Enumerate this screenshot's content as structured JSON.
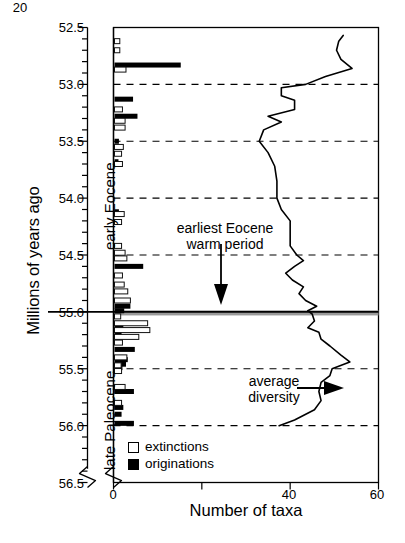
{
  "axes": {
    "ylabel": "Millions of years ago",
    "xlabel": "Number of taxa",
    "y_ticks": [
      "52.5",
      "53.0",
      "53.5",
      "54.0",
      "54.5",
      "55.0",
      "55.5",
      "56.0",
      "56.5"
    ],
    "x_ticks": [
      "0",
      "20",
      "40",
      "60"
    ],
    "ylim": [
      52.5,
      56.5
    ],
    "xlim": [
      0,
      60
    ],
    "y_inverted": true,
    "grid": "dashed horizontal gridlines at each major y tick"
  },
  "era_labels": [
    {
      "name": "early-eocene",
      "text": "early Eocene"
    },
    {
      "name": "late-paleocene",
      "text": "late Paleocene"
    }
  ],
  "annotations": [
    {
      "name": "warm-period",
      "line1": "earliest Eocene",
      "line2": "warm period"
    },
    {
      "name": "average-diversity",
      "line1": "average",
      "line2": "diversity"
    }
  ],
  "legend": {
    "extinctions": "extinctions",
    "originations": "originations"
  },
  "colors": {
    "extinctions": "#ffffff",
    "originations": "#000000",
    "axis": "#000000",
    "grid": "#000000",
    "petm_band": "#9a9a9a",
    "background": "#ffffff"
  },
  "chart_data": {
    "type": "bar",
    "title": "",
    "xlabel": "Number of taxa",
    "ylabel": "Millions of years ago",
    "xlim": [
      0,
      60
    ],
    "ylim": [
      52.5,
      56.5
    ],
    "y_inverted": true,
    "grid": true,
    "legend_position": "inside lower-left",
    "orientation": "horizontal",
    "series": [
      {
        "name": "extinctions",
        "style": "open bar",
        "points": [
          {
            "age": 52.62,
            "value": 1.2
          },
          {
            "age": 52.7,
            "value": 1.2
          },
          {
            "age": 52.87,
            "value": 2.6
          },
          {
            "age": 53.22,
            "value": 1.8
          },
          {
            "age": 53.32,
            "value": 2.4
          },
          {
            "age": 53.38,
            "value": 2.4
          },
          {
            "age": 53.55,
            "value": 2.0
          },
          {
            "age": 53.61,
            "value": 1.6
          },
          {
            "age": 53.7,
            "value": 1.8
          },
          {
            "age": 54.14,
            "value": 2.2
          },
          {
            "age": 54.21,
            "value": 1.6
          },
          {
            "age": 54.42,
            "value": 1.6
          },
          {
            "age": 54.48,
            "value": 2.4
          },
          {
            "age": 54.53,
            "value": 2.8
          },
          {
            "age": 54.68,
            "value": 1.8
          },
          {
            "age": 54.76,
            "value": 2.2
          },
          {
            "age": 54.82,
            "value": 3.0
          },
          {
            "age": 54.9,
            "value": 3.6
          },
          {
            "age": 55.04,
            "value": 1.4
          },
          {
            "age": 55.1,
            "value": 7.5
          },
          {
            "age": 55.16,
            "value": 8.0
          },
          {
            "age": 55.22,
            "value": 5.5
          },
          {
            "age": 55.27,
            "value": 1.8
          },
          {
            "age": 55.4,
            "value": 2.8
          },
          {
            "age": 55.47,
            "value": 1.5
          },
          {
            "age": 55.52,
            "value": 1.6
          },
          {
            "age": 55.66,
            "value": 2.4
          },
          {
            "age": 55.8,
            "value": 1.6
          }
        ]
      },
      {
        "name": "originations",
        "style": "filled bar",
        "points": [
          {
            "age": 52.83,
            "value": 15.0
          },
          {
            "age": 53.13,
            "value": 4.2
          },
          {
            "age": 53.28,
            "value": 5.2
          },
          {
            "age": 53.5,
            "value": 1.0
          },
          {
            "age": 53.68,
            "value": 0.9
          },
          {
            "age": 54.12,
            "value": 1.0
          },
          {
            "age": 54.49,
            "value": 1.0
          },
          {
            "age": 54.6,
            "value": 6.5
          },
          {
            "age": 54.95,
            "value": 3.6
          },
          {
            "age": 54.99,
            "value": 2.2
          },
          {
            "age": 55.12,
            "value": 2.0
          },
          {
            "age": 55.18,
            "value": 1.6
          },
          {
            "age": 55.33,
            "value": 4.6
          },
          {
            "age": 55.42,
            "value": 3.0
          },
          {
            "age": 55.46,
            "value": 2.6
          },
          {
            "age": 55.49,
            "value": 1.8
          },
          {
            "age": 55.7,
            "value": 4.4
          },
          {
            "age": 55.84,
            "value": 2.0
          },
          {
            "age": 55.9,
            "value": 1.6
          },
          {
            "age": 55.98,
            "value": 4.4
          }
        ]
      },
      {
        "name": "average diversity",
        "style": "line",
        "points": [
          {
            "age": 52.57,
            "value": 52.0
          },
          {
            "age": 52.62,
            "value": 51.0
          },
          {
            "age": 52.7,
            "value": 50.5
          },
          {
            "age": 52.78,
            "value": 51.5
          },
          {
            "age": 52.86,
            "value": 54.0
          },
          {
            "age": 52.93,
            "value": 48.0
          },
          {
            "age": 53.0,
            "value": 43.5
          },
          {
            "age": 53.03,
            "value": 38.0
          },
          {
            "age": 53.1,
            "value": 38.0
          },
          {
            "age": 53.14,
            "value": 41.0
          },
          {
            "age": 53.22,
            "value": 41.0
          },
          {
            "age": 53.28,
            "value": 35.0
          },
          {
            "age": 53.33,
            "value": 38.0
          },
          {
            "age": 53.4,
            "value": 34.0
          },
          {
            "age": 53.5,
            "value": 33.0
          },
          {
            "age": 53.6,
            "value": 35.0
          },
          {
            "age": 53.72,
            "value": 36.5
          },
          {
            "age": 53.85,
            "value": 37.0
          },
          {
            "age": 54.0,
            "value": 37.0
          },
          {
            "age": 54.1,
            "value": 38.0
          },
          {
            "age": 54.2,
            "value": 40.0
          },
          {
            "age": 54.3,
            "value": 40.0
          },
          {
            "age": 54.42,
            "value": 40.0
          },
          {
            "age": 54.5,
            "value": 41.5
          },
          {
            "age": 54.55,
            "value": 43.0
          },
          {
            "age": 54.6,
            "value": 41.0
          },
          {
            "age": 54.66,
            "value": 39.0
          },
          {
            "age": 54.72,
            "value": 40.5
          },
          {
            "age": 54.78,
            "value": 43.0
          },
          {
            "age": 54.84,
            "value": 42.0
          },
          {
            "age": 54.9,
            "value": 43.5
          },
          {
            "age": 54.95,
            "value": 46.0
          },
          {
            "age": 54.99,
            "value": 44.0
          },
          {
            "age": 55.02,
            "value": 45.0
          },
          {
            "age": 55.08,
            "value": 45.5
          },
          {
            "age": 55.14,
            "value": 44.0
          },
          {
            "age": 55.18,
            "value": 46.5
          },
          {
            "age": 55.24,
            "value": 47.0
          },
          {
            "age": 55.3,
            "value": 49.0
          },
          {
            "age": 55.38,
            "value": 51.5
          },
          {
            "age": 55.44,
            "value": 53.5
          },
          {
            "age": 55.5,
            "value": 49.5
          },
          {
            "age": 55.56,
            "value": 49.0
          },
          {
            "age": 55.62,
            "value": 47.0
          },
          {
            "age": 55.7,
            "value": 46.5
          },
          {
            "age": 55.78,
            "value": 47.0
          },
          {
            "age": 55.86,
            "value": 45.5
          },
          {
            "age": 55.95,
            "value": 41.0
          },
          {
            "age": 56.0,
            "value": 37.5
          }
        ]
      }
    ],
    "bands": [
      {
        "name": "earliest Eocene warm period",
        "age_center": 55.0,
        "thickness_myr": 0.045,
        "color": "#9a9a9a"
      }
    ]
  }
}
